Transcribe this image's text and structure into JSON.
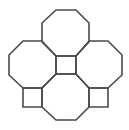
{
  "diagram": {
    "title": "",
    "background": "#ffffff",
    "stroke_color": "#4a4a4a",
    "octagons": [
      {
        "name": "top",
        "points": "56,10 76,10 89,23 89,42 76,56 56,56 42,42 42,23"
      },
      {
        "name": "left",
        "points": "23,41 42,41 56,56 56,74 42,88 23,88 9,75 9,55"
      },
      {
        "name": "right",
        "points": "89,41 108,41 122,55 122,75 108,88 89,88 76,74 76,56"
      },
      {
        "name": "bottom",
        "points": "56,74 76,74 89,88 89,107 76,120 56,120 42,107 42,88"
      }
    ],
    "squares": [
      {
        "name": "center",
        "points": "56,56 76,56 76,74 56,74"
      },
      {
        "name": "bottom-left",
        "points": "23,88 42,88 42,107 23,107"
      },
      {
        "name": "bottom-right",
        "points": "89,88 108,88 108,107 89,107"
      }
    ]
  }
}
